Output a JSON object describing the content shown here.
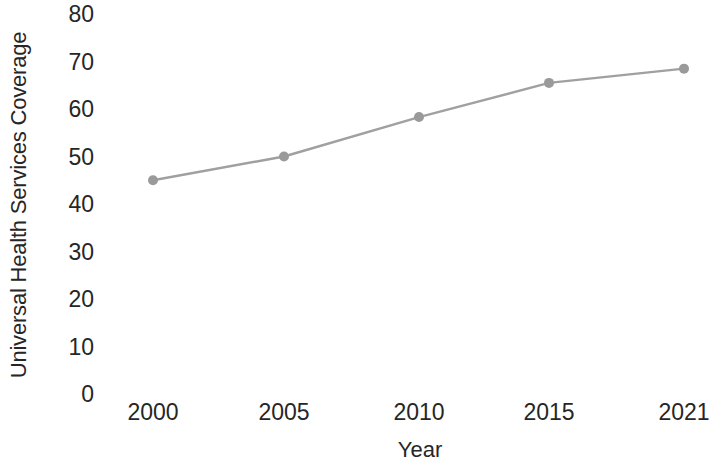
{
  "chart_data": {
    "type": "line",
    "title": "",
    "subtitle": "",
    "xlabel": "Year",
    "ylabel": "Universal Health Services Coverage",
    "categories": [
      "2000",
      "2005",
      "2010",
      "2015",
      "2021"
    ],
    "values": [
      45,
      50,
      58.3,
      65.5,
      68.5
    ],
    "series": [
      {
        "name": "Universal Health Services Coverage",
        "values": [
          45,
          50,
          58.3,
          65.5,
          68.5
        ]
      }
    ],
    "ylim": [
      0,
      80
    ],
    "y_ticks": [
      0,
      10,
      20,
      30,
      40,
      50,
      60,
      70,
      80
    ],
    "y_tick_labels": [
      "0",
      "10",
      "20",
      "30",
      "40",
      "50",
      "60",
      "70",
      "80"
    ],
    "x_tick_labels": [
      "2000",
      "2005",
      "2010",
      "2015",
      "2021"
    ],
    "grid": false,
    "legend": "none",
    "colors": {
      "line": "#a0a0a0",
      "marker": "#9a9a9a",
      "text": "#262626",
      "background": "#ffffff"
    },
    "style": {
      "line_width": 2.4,
      "marker_size": 10,
      "marker_shape": "circle"
    }
  }
}
